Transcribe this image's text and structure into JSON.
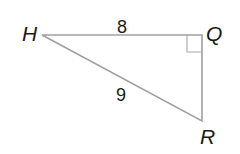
{
  "diagram": {
    "type": "right-triangle",
    "vertices": {
      "H": {
        "label": "H",
        "x": 42,
        "y": 35
      },
      "Q": {
        "label": "Q",
        "x": 202,
        "y": 35
      },
      "R": {
        "label": "R",
        "x": 202,
        "y": 121
      }
    },
    "sides": {
      "HQ": {
        "label": "8"
      },
      "HR": {
        "label": "9"
      },
      "QR": {
        "label": ""
      }
    },
    "right_angle_at": "Q",
    "line_color": "#a0a0a0",
    "text_color": "#1a1a1a"
  }
}
